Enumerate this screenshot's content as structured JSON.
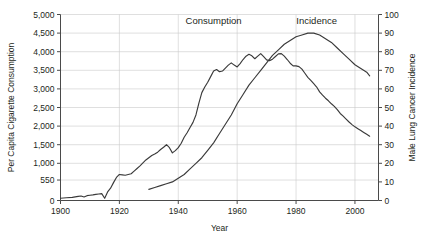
{
  "chart_data": {
    "type": "line",
    "title": "",
    "xlabel": "Year",
    "ylabel": "Per Capita Cigarette Consumption",
    "y2label": "Male Lung Cancer Incidence",
    "xlim": [
      1900,
      2008
    ],
    "ylim": [
      0,
      5000
    ],
    "y2lim": [
      0,
      100
    ],
    "grid": true,
    "legend_position": "inline-annotations",
    "xticks": [
      "1900",
      "1920",
      "1940",
      "1960",
      "1980",
      "2000"
    ],
    "xtick_values": [
      1900,
      1920,
      1940,
      1960,
      1980,
      2000
    ],
    "yticks": [
      "0",
      "550",
      "1,000",
      "1,500",
      "2,000",
      "2,500",
      "3,000",
      "3,500",
      "4,000",
      "4,500",
      "5,000"
    ],
    "ytick_values": [
      0,
      550,
      1000,
      1500,
      2000,
      2500,
      3000,
      3500,
      4000,
      4500,
      5000
    ],
    "y2ticks": [
      "0",
      "10",
      "20",
      "30",
      "40",
      "50",
      "60",
      "70",
      "80",
      "90",
      "100"
    ],
    "y2tick_values": [
      0,
      10,
      20,
      30,
      40,
      50,
      60,
      70,
      80,
      90,
      100
    ],
    "annotations": [
      {
        "text": "Consumption",
        "x": 1952,
        "y": 4750,
        "name": "consumption-label"
      },
      {
        "text": "Incidence",
        "x": 1987,
        "y": 4750,
        "name": "incidence-label"
      }
    ],
    "series": [
      {
        "name": "Consumption",
        "axis": "left",
        "color": "#3a3a3a",
        "x": [
          1900,
          1902,
          1904,
          1906,
          1907,
          1908,
          1909,
          1910,
          1911,
          1912,
          1913,
          1914,
          1915,
          1916,
          1917,
          1918,
          1919,
          1920,
          1921,
          1922,
          1923,
          1924,
          1925,
          1926,
          1927,
          1928,
          1929,
          1930,
          1931,
          1932,
          1933,
          1934,
          1935,
          1936,
          1937,
          1938,
          1939,
          1940,
          1941,
          1942,
          1943,
          1944,
          1945,
          1946,
          1947,
          1948,
          1949,
          1950,
          1951,
          1952,
          1953,
          1954,
          1955,
          1956,
          1957,
          1958,
          1959,
          1960,
          1961,
          1962,
          1963,
          1964,
          1965,
          1966,
          1967,
          1968,
          1969,
          1970,
          1971,
          1972,
          1973,
          1974,
          1975,
          1976,
          1977,
          1978,
          1979,
          1980,
          1981,
          1982,
          1983,
          1984,
          1985,
          1986,
          1987,
          1988,
          1989,
          1990,
          1991,
          1992,
          1993,
          1994,
          1995,
          1996,
          1997,
          1998,
          1999,
          2000,
          2001,
          2002,
          2003,
          2004,
          2005
        ],
        "y": [
          60,
          75,
          85,
          110,
          120,
          95,
          130,
          140,
          150,
          165,
          175,
          185,
          60,
          230,
          330,
          480,
          620,
          700,
          690,
          680,
          700,
          720,
          790,
          860,
          930,
          1010,
          1090,
          1150,
          1210,
          1250,
          1300,
          1370,
          1430,
          1500,
          1420,
          1280,
          1340,
          1420,
          1540,
          1700,
          1820,
          1960,
          2100,
          2300,
          2620,
          2900,
          3050,
          3180,
          3330,
          3480,
          3520,
          3460,
          3480,
          3560,
          3640,
          3700,
          3640,
          3590,
          3680,
          3790,
          3880,
          3930,
          3890,
          3810,
          3880,
          3950,
          3870,
          3780,
          3760,
          3800,
          3870,
          3940,
          3950,
          3880,
          3790,
          3690,
          3620,
          3620,
          3600,
          3530,
          3420,
          3310,
          3230,
          3140,
          3050,
          2920,
          2830,
          2750,
          2680,
          2600,
          2530,
          2440,
          2340,
          2270,
          2190,
          2110,
          2040,
          1980,
          1930,
          1880,
          1830,
          1780,
          1730
        ]
      },
      {
        "name": "Incidence",
        "axis": "right",
        "color": "#3a3a3a",
        "x": [
          1930,
          1932,
          1934,
          1936,
          1938,
          1940,
          1942,
          1944,
          1946,
          1948,
          1950,
          1952,
          1954,
          1956,
          1958,
          1960,
          1962,
          1964,
          1966,
          1968,
          1970,
          1972,
          1974,
          1976,
          1978,
          1980,
          1982,
          1984,
          1986,
          1988,
          1990,
          1992,
          1994,
          1996,
          1998,
          2000,
          2002,
          2004,
          2005
        ],
        "y": [
          6,
          7,
          8,
          9,
          10,
          12,
          14,
          17,
          20,
          23,
          27,
          31,
          36,
          41,
          46,
          52,
          57,
          62,
          66,
          70,
          74,
          78,
          81,
          84,
          86,
          88,
          89,
          90,
          90,
          89,
          87,
          85,
          82,
          79,
          76,
          73,
          71,
          69,
          67
        ]
      }
    ]
  },
  "axis_labels": {
    "x_title": "Year",
    "y_left_title": "Per Capita Cigarette Consumption",
    "y_right_title": "Male Lung Cancer Incidence"
  },
  "colors": {
    "line": "#3a3a3a",
    "grid": "#c9c9c9",
    "axis": "#4a4a4a",
    "text": "#231f20",
    "background": "#ffffff"
  }
}
